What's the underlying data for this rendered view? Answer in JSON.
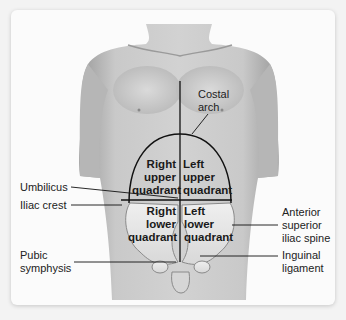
{
  "diagram": {
    "quadrants": {
      "right_upper": [
        "Right",
        "upper",
        "quadrant"
      ],
      "left_upper": [
        "Left",
        "upper",
        "quadrant"
      ],
      "right_lower": [
        "Right",
        "lower",
        "quadrant"
      ],
      "left_lower": [
        "Left",
        "lower",
        "quadrant"
      ]
    },
    "labels": {
      "costal_arch": [
        "Costal",
        "arch"
      ],
      "umbilicus": "Umbilicus",
      "iliac_crest": "Iliac crest",
      "anterior_superior_iliac_spine": [
        "Anterior",
        "superior",
        "iliac spine"
      ],
      "pubic_symphysis": [
        "Pubic",
        "symphysis"
      ],
      "inguinal_ligament": [
        "Inguinal",
        "ligament"
      ]
    },
    "colors": {
      "skin": "#c8c8c8",
      "skin_shadow": "#9e9e9e",
      "bone": "#e6e6e6",
      "line": "#111111",
      "background": "#fbfbfb"
    }
  }
}
